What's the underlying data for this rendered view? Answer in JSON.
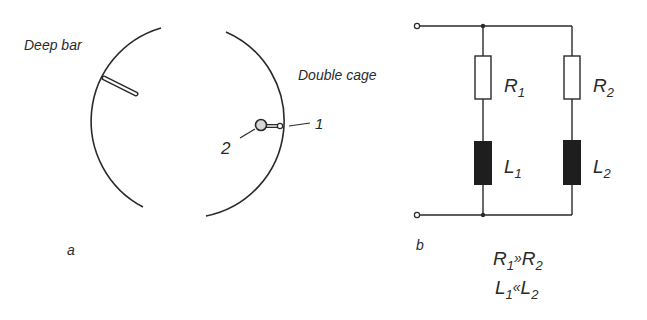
{
  "panel_a": {
    "caption": "a",
    "deep_bar_label": "Deep bar",
    "double_cage_label": "Double cage",
    "marker_1": "1",
    "marker_2": "2"
  },
  "panel_b": {
    "caption": "b",
    "R1": "R",
    "R1_sub": "1",
    "R2": "R",
    "R2_sub": "2",
    "L1": "L",
    "L1_sub": "1",
    "L2": "L",
    "L2_sub": "2",
    "relation_1": {
      "a": "R",
      "a_sub": "1",
      "op": "»",
      "b": "R",
      "b_sub": "2"
    },
    "relation_2": {
      "a": "L",
      "a_sub": "1",
      "op": "«",
      "b": "L",
      "b_sub": "2"
    }
  },
  "colors": {
    "ink": "#2a2a2a",
    "inductor_fill": "#1e1e1e",
    "slot_fill": "#d8d8d8"
  }
}
